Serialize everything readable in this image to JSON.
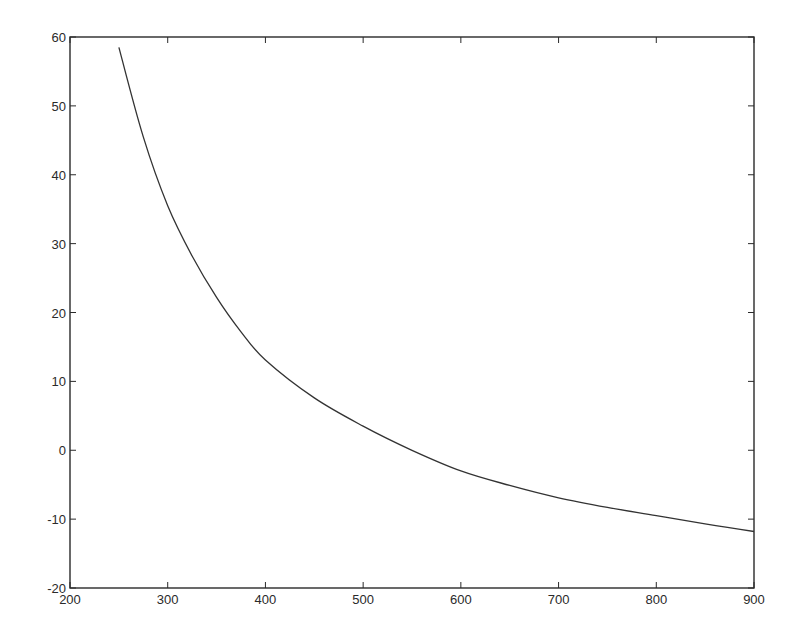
{
  "chart_data": {
    "type": "line",
    "title": "",
    "xlabel": "",
    "ylabel": "",
    "xlim": [
      200,
      900
    ],
    "ylim": [
      -20,
      60
    ],
    "x_ticks": [
      200,
      300,
      400,
      500,
      600,
      700,
      800,
      900
    ],
    "y_ticks": [
      -20,
      -10,
      0,
      10,
      20,
      30,
      40,
      50,
      60
    ],
    "grid": false,
    "legend": null,
    "series": [
      {
        "name": "curve",
        "color": "#333333",
        "x": [
          250,
          275,
          300,
          325,
          350,
          375,
          400,
          450,
          500,
          550,
          600,
          650,
          700,
          750,
          800,
          850,
          900
        ],
        "y": [
          58.5,
          45.5,
          35.5,
          28.2,
          22.2,
          17.2,
          13.1,
          7.6,
          3.5,
          0.0,
          -3.0,
          -5.1,
          -6.9,
          -8.3,
          -9.5,
          -10.7,
          -11.8
        ]
      }
    ]
  },
  "colors": {
    "axis": "#2a2a2a",
    "line": "#333333",
    "background": "#ffffff"
  }
}
